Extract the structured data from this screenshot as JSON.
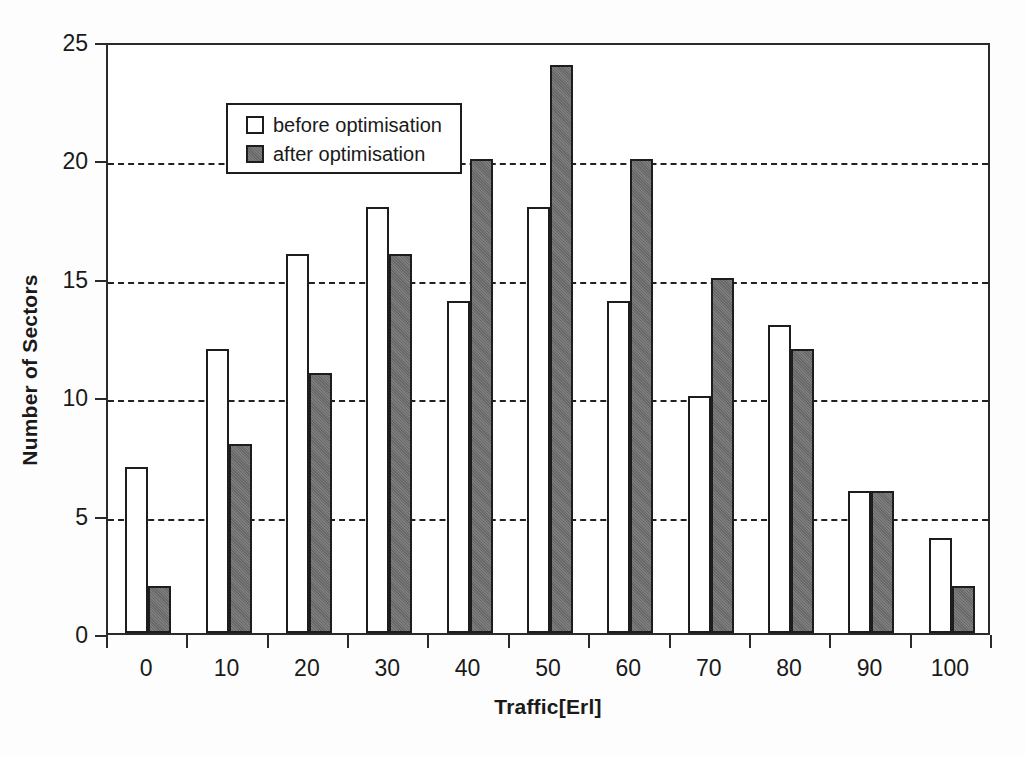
{
  "chart_data": {
    "type": "bar",
    "title": "",
    "xlabel": "Traffic[Erl]",
    "ylabel": "Number of Sectors",
    "categories": [
      "0",
      "10",
      "20",
      "30",
      "40",
      "50",
      "60",
      "70",
      "80",
      "90",
      "100"
    ],
    "series": [
      {
        "name": "before optimisation",
        "color": "#ffffff",
        "values": [
          7,
          12,
          16,
          18,
          14,
          18,
          14,
          10,
          13,
          6,
          4
        ]
      },
      {
        "name": "after optimisation",
        "color": "#6f6f6f",
        "values": [
          2,
          8,
          11,
          16,
          20,
          24,
          20,
          15,
          12,
          6,
          2
        ]
      }
    ],
    "ylim": [
      0,
      25
    ],
    "ytick_values": [
      0,
      5,
      10,
      15,
      20,
      25
    ],
    "ytick_labels": [
      "0",
      "5",
      "10",
      "15",
      "20",
      "25"
    ],
    "grid": "horizontal-dashed",
    "legend_position": "top-left-inside"
  },
  "legend": {
    "entries": [
      {
        "label": "before optimisation",
        "swatch": "legend-swatch-before"
      },
      {
        "label": "after optimisation",
        "swatch": "legend-swatch-after"
      }
    ]
  },
  "colors": {
    "bar_before_fill": "#ffffff",
    "bar_after_fill": "#6f6f6f",
    "outline": "#1d1d1d",
    "axis": "#2a2a2a",
    "grid": "#222222",
    "background": "#fdfdfd"
  }
}
